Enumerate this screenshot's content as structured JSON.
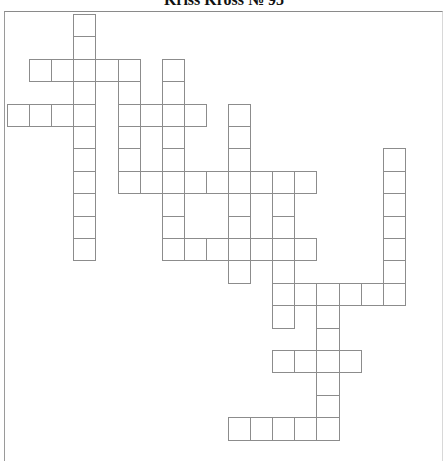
{
  "puzzle": {
    "title": "Kriss Kross № 95",
    "grid": {
      "origin_x": 7,
      "origin_y": 14,
      "cell_w": 22.1,
      "cell_h": 22.4,
      "line_color": "#8c8c8c",
      "entries": [
        {
          "id": "v1",
          "direction": "down",
          "col": 3,
          "row": 0,
          "length": 11
        },
        {
          "id": "a1",
          "direction": "across",
          "col": 1,
          "row": 2,
          "length": 5
        },
        {
          "id": "v2",
          "direction": "down",
          "col": 5,
          "row": 2,
          "length": 6
        },
        {
          "id": "v3",
          "direction": "down",
          "col": 7,
          "row": 2,
          "length": 9
        },
        {
          "id": "a2",
          "direction": "across",
          "col": 0,
          "row": 4,
          "length": 4
        },
        {
          "id": "a3",
          "direction": "across",
          "col": 5,
          "row": 4,
          "length": 4
        },
        {
          "id": "v4",
          "direction": "down",
          "col": 10,
          "row": 4,
          "length": 8
        },
        {
          "id": "v5",
          "direction": "down",
          "col": 17,
          "row": 6,
          "length": 7
        },
        {
          "id": "a4",
          "direction": "across",
          "col": 5,
          "row": 7,
          "length": 9
        },
        {
          "id": "v6",
          "direction": "down",
          "col": 12,
          "row": 7,
          "length": 7
        },
        {
          "id": "a5",
          "direction": "across",
          "col": 7,
          "row": 10,
          "length": 7
        },
        {
          "id": "a6",
          "direction": "across",
          "col": 12,
          "row": 12,
          "length": 6
        },
        {
          "id": "v7",
          "direction": "down",
          "col": 14,
          "row": 12,
          "length": 7
        },
        {
          "id": "a7",
          "direction": "across",
          "col": 12,
          "row": 15,
          "length": 4
        },
        {
          "id": "a8",
          "direction": "across",
          "col": 10,
          "row": 18,
          "length": 5
        }
      ]
    }
  }
}
